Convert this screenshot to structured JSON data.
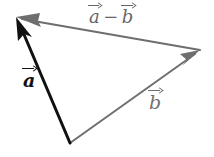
{
  "figure": {
    "width": 214,
    "height": 157,
    "background_color": "#ffffff"
  },
  "colors": {
    "vector_a_stroke": "#111111",
    "vector_b_stroke": "#6e6e6e",
    "vector_a_minus_b_stroke": "#6e6e6e",
    "label_a_color": "#111111",
    "label_b_color": "#707070",
    "label_a_minus_b_color": "#666666"
  },
  "geometry": {
    "origin_vertex": {
      "x": 70,
      "y": 143
    },
    "head_a_vertex": {
      "x": 16,
      "y": 17
    },
    "head_b_vertex": {
      "x": 200,
      "y": 50
    }
  },
  "labels": {
    "a": {
      "letter": "a",
      "text": "a"
    },
    "b": {
      "letter": "b",
      "text": "b"
    },
    "a_minus_b": {
      "first": "a",
      "operator": "−",
      "second": "b",
      "text": "a − b"
    }
  },
  "vectors": [
    {
      "name": "a",
      "label": "a",
      "color": "#111111",
      "stroke_width": 3,
      "from": {
        "x": 70,
        "y": 143
      },
      "to": {
        "x": 16,
        "y": 17
      },
      "arrowhead": "at-tip"
    },
    {
      "name": "b",
      "label": "b",
      "color": "#6e6e6e",
      "stroke_width": 2,
      "from": {
        "x": 70,
        "y": 143
      },
      "to": {
        "x": 200,
        "y": 50
      },
      "arrowhead": "at-tip"
    },
    {
      "name": "a-minus-b",
      "label": "a − b",
      "color": "#6e6e6e",
      "stroke_width": 2,
      "from": {
        "x": 200,
        "y": 50
      },
      "to": {
        "x": 16,
        "y": 17
      },
      "arrowhead": "at-tip"
    }
  ]
}
